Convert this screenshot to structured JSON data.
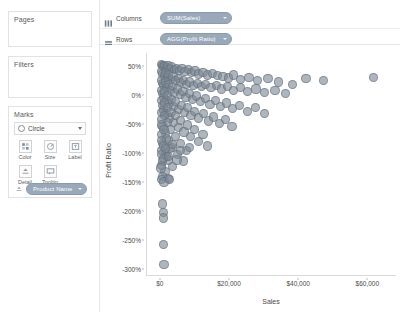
{
  "sidebar": {
    "pages": {
      "title": "Pages"
    },
    "filters": {
      "title": "Filters"
    },
    "marks": {
      "title": "Marks",
      "mark_type": "Circle",
      "mark_type_icon": "circle-icon",
      "dropdown_icon": "chevron-down-icon",
      "buttons": [
        {
          "label": "Color",
          "icon": "color-icon"
        },
        {
          "label": "Size",
          "icon": "size-icon"
        },
        {
          "label": "Label",
          "icon": "label-icon"
        },
        {
          "label": "Detail",
          "icon": "detail-icon"
        },
        {
          "label": "Tooltip",
          "icon": "tooltip-icon"
        }
      ],
      "detail_pill": {
        "label": "Product Name",
        "icon": "detail-icon"
      }
    }
  },
  "shelves": [
    {
      "name": "Columns",
      "icon": "columns-icon",
      "pill": "SUM(Sales)"
    },
    {
      "name": "Rows",
      "icon": "rows-icon",
      "pill": "AGG(Profit Ratio)"
    }
  ],
  "colors": {
    "mark_fill": "#7c8894",
    "pill_fill": "#9aa9b9",
    "axis_line": "#d9d9d9",
    "text": "#4a4a4a"
  },
  "chart_data": {
    "type": "scatter",
    "title": "",
    "xlabel": "Sales",
    "ylabel": "Profit Ratio",
    "xlim": [
      -4000,
      68000
    ],
    "ylim": [
      -3.1,
      0.72
    ],
    "grid": false,
    "legend": false,
    "xticks": [
      0,
      20000,
      40000,
      60000
    ],
    "xticklabels": [
      "$0",
      "$20,000",
      "$40,000",
      "$60,000"
    ],
    "yticks": [
      0.5,
      0,
      -0.5,
      -1.0,
      -1.5,
      -2.0,
      -2.5,
      -3.0
    ],
    "yticklabels": [
      "50%",
      "0%",
      "-50%",
      "-100%",
      "-150%",
      "-200%",
      "-250%",
      "-300%"
    ],
    "series": [
      {
        "name": "Product Name",
        "marker": "circle",
        "color": "#7c8894",
        "opacity": 0.62,
        "points": [
          [
            300,
            0.52
          ],
          [
            420,
            0.5
          ],
          [
            700,
            0.49
          ],
          [
            1100,
            0.51
          ],
          [
            1600,
            0.47
          ],
          [
            2100,
            0.5
          ],
          [
            2600,
            0.45
          ],
          [
            3200,
            0.48
          ],
          [
            3900,
            0.44
          ],
          [
            4600,
            0.46
          ],
          [
            5400,
            0.42
          ],
          [
            6100,
            0.45
          ],
          [
            7000,
            0.4
          ],
          [
            7900,
            0.43
          ],
          [
            8800,
            0.38
          ],
          [
            9900,
            0.41
          ],
          [
            11000,
            0.36
          ],
          [
            12200,
            0.39
          ],
          [
            13500,
            0.34
          ],
          [
            15000,
            0.37
          ],
          [
            16400,
            0.33
          ],
          [
            18000,
            0.31
          ],
          [
            19500,
            0.29
          ],
          [
            21000,
            0.34
          ],
          [
            23000,
            0.27
          ],
          [
            25500,
            0.3
          ],
          [
            28000,
            0.25
          ],
          [
            31000,
            0.28
          ],
          [
            34000,
            0.22
          ],
          [
            250,
            0.4
          ],
          [
            600,
            0.36
          ],
          [
            950,
            0.33
          ],
          [
            1400,
            0.38
          ],
          [
            1850,
            0.3
          ],
          [
            2300,
            0.34
          ],
          [
            2900,
            0.27
          ],
          [
            3500,
            0.31
          ],
          [
            4200,
            0.24
          ],
          [
            5000,
            0.28
          ],
          [
            5800,
            0.21
          ],
          [
            6600,
            0.25
          ],
          [
            7500,
            0.18
          ],
          [
            8400,
            0.22
          ],
          [
            9400,
            0.16
          ],
          [
            10500,
            0.2
          ],
          [
            11800,
            0.14
          ],
          [
            13000,
            0.18
          ],
          [
            14500,
            0.12
          ],
          [
            16000,
            0.16
          ],
          [
            17600,
            0.1
          ],
          [
            19200,
            0.14
          ],
          [
            21000,
            0.08
          ],
          [
            23000,
            0.12
          ],
          [
            25000,
            0.06
          ],
          [
            27500,
            0.1
          ],
          [
            30000,
            0.04
          ],
          [
            33000,
            0.08
          ],
          [
            36000,
            0.02
          ],
          [
            200,
            0.25
          ],
          [
            500,
            0.2
          ],
          [
            850,
            0.16
          ],
          [
            1250,
            0.22
          ],
          [
            1700,
            0.12
          ],
          [
            2200,
            0.18
          ],
          [
            2750,
            0.08
          ],
          [
            3350,
            0.14
          ],
          [
            4000,
            0.04
          ],
          [
            4800,
            0.1
          ],
          [
            5600,
            0.0
          ],
          [
            6400,
            0.06
          ],
          [
            7300,
            -0.04
          ],
          [
            8200,
            0.02
          ],
          [
            9200,
            -0.08
          ],
          [
            10300,
            -0.02
          ],
          [
            11500,
            -0.12
          ],
          [
            12800,
            -0.06
          ],
          [
            14200,
            -0.16
          ],
          [
            15700,
            -0.1
          ],
          [
            17300,
            -0.2
          ],
          [
            19000,
            -0.14
          ],
          [
            20800,
            -0.24
          ],
          [
            22800,
            -0.18
          ],
          [
            25000,
            -0.28
          ],
          [
            27400,
            -0.22
          ],
          [
            30000,
            -0.32
          ],
          [
            180,
            0.08
          ],
          [
            450,
            0.02
          ],
          [
            780,
            -0.05
          ],
          [
            1150,
            0.05
          ],
          [
            1550,
            -0.1
          ],
          [
            2000,
            -0.02
          ],
          [
            2500,
            -0.15
          ],
          [
            3050,
            -0.08
          ],
          [
            3650,
            -0.2
          ],
          [
            4350,
            -0.12
          ],
          [
            5100,
            -0.25
          ],
          [
            5900,
            -0.18
          ],
          [
            6800,
            -0.3
          ],
          [
            7700,
            -0.22
          ],
          [
            8700,
            -0.35
          ],
          [
            9800,
            -0.28
          ],
          [
            11000,
            -0.4
          ],
          [
            12300,
            -0.32
          ],
          [
            13700,
            -0.45
          ],
          [
            15200,
            -0.38
          ],
          [
            16900,
            -0.5
          ],
          [
            18700,
            -0.42
          ],
          [
            20600,
            -0.55
          ],
          [
            150,
            -0.1
          ],
          [
            400,
            -0.18
          ],
          [
            720,
            -0.26
          ],
          [
            1080,
            -0.14
          ],
          [
            1480,
            -0.32
          ],
          [
            1920,
            -0.22
          ],
          [
            2400,
            -0.4
          ],
          [
            2950,
            -0.3
          ],
          [
            3550,
            -0.48
          ],
          [
            4250,
            -0.36
          ],
          [
            5000,
            -0.56
          ],
          [
            5800,
            -0.44
          ],
          [
            6700,
            -0.64
          ],
          [
            7600,
            -0.52
          ],
          [
            8600,
            -0.72
          ],
          [
            9700,
            -0.6
          ],
          [
            10900,
            -0.8
          ],
          [
            12200,
            -0.68
          ],
          [
            13600,
            -0.88
          ],
          [
            120,
            -0.3
          ],
          [
            350,
            -0.42
          ],
          [
            650,
            -0.54
          ],
          [
            1000,
            -0.36
          ],
          [
            1400,
            -0.66
          ],
          [
            1820,
            -0.48
          ],
          [
            2300,
            -0.78
          ],
          [
            2850,
            -0.6
          ],
          [
            3450,
            -0.9
          ],
          [
            4150,
            -0.72
          ],
          [
            4900,
            -1.02
          ],
          [
            5700,
            -0.84
          ],
          [
            6600,
            -1.14
          ],
          [
            7500,
            -0.96
          ],
          [
            100,
            -0.52
          ],
          [
            300,
            -0.68
          ],
          [
            580,
            -0.84
          ],
          [
            900,
            -0.6
          ],
          [
            1300,
            -1.0
          ],
          [
            1720,
            -0.76
          ],
          [
            2200,
            -1.12
          ],
          [
            2750,
            -0.92
          ],
          [
            3350,
            -1.24
          ],
          [
            90,
            -0.78
          ],
          [
            260,
            -0.96
          ],
          [
            520,
            -1.14
          ],
          [
            820,
            -0.88
          ],
          [
            1200,
            -1.32
          ],
          [
            1620,
            -1.06
          ],
          [
            2100,
            -1.44
          ],
          [
            80,
            -1.02
          ],
          [
            220,
            -1.22
          ],
          [
            470,
            -1.4
          ],
          [
            760,
            -1.1
          ],
          [
            70,
            -1.26
          ],
          [
            190,
            -1.46
          ],
          [
            1300,
            -0.92
          ],
          [
            3400,
            -0.86
          ],
          [
            5600,
            -0.96
          ],
          [
            8200,
            -0.9
          ],
          [
            2200,
            -1.06
          ],
          [
            4700,
            -1.12
          ],
          [
            900,
            -1.5
          ],
          [
            2400,
            -1.46
          ],
          [
            600,
            -1.88
          ],
          [
            700,
            -2.02
          ],
          [
            750,
            -2.12
          ],
          [
            800,
            -2.58
          ],
          [
            900,
            -2.92
          ],
          [
            38000,
            0.18
          ],
          [
            42000,
            0.28
          ],
          [
            47000,
            0.24
          ],
          [
            61500,
            0.3
          ]
        ]
      }
    ]
  }
}
